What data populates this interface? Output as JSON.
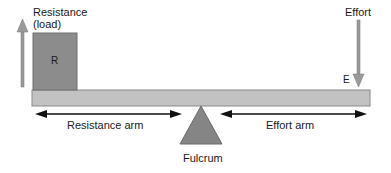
{
  "diagram": {
    "type": "first-class lever",
    "labels": {
      "resistance": "Resistance",
      "resistance_sub": "(load)",
      "effort": "Effort",
      "box_letter": "R",
      "effort_letter": "E",
      "resistance_arm": "Resistance arm",
      "effort_arm": "Effort arm",
      "fulcrum": "Fulcrum"
    },
    "colors": {
      "beam": "#c2c2c2",
      "beam_border": "#8a8a8a",
      "load_box": "#8c8c8c",
      "fulcrum": "#858585",
      "force_arrow": "#9a9a9a",
      "arm_arrow": "#111111"
    }
  }
}
